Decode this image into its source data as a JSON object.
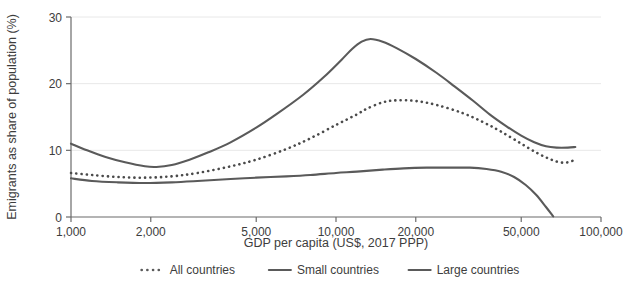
{
  "chart_data": {
    "type": "line",
    "title": "",
    "xlabel": "GDP per capita (US$, 2017 PPP)",
    "ylabel": "Emigrants as share of population (%)",
    "x_scale": "log",
    "xlim": [
      1000,
      100000
    ],
    "ylim": [
      0,
      30
    ],
    "xticks": [
      1000,
      2000,
      5000,
      10000,
      20000,
      50000,
      100000
    ],
    "xtick_labels": [
      "1,000",
      "2,000",
      "5,000",
      "10,000",
      "20,000",
      "50,000",
      "100,000"
    ],
    "yticks": [
      0,
      10,
      20,
      30
    ],
    "ytick_labels": [
      "0",
      "10",
      "20",
      "30"
    ],
    "grid": "horizontal",
    "legend_position": "bottom",
    "series": [
      {
        "name": "All countries",
        "style": "dotted",
        "color": "#4a4a4a",
        "points": [
          [
            1000,
            6.6
          ],
          [
            1200,
            6.3
          ],
          [
            1500,
            6.0
          ],
          [
            1900,
            5.9
          ],
          [
            2400,
            6.1
          ],
          [
            3000,
            6.6
          ],
          [
            4000,
            7.6
          ],
          [
            5000,
            8.6
          ],
          [
            6500,
            10.2
          ],
          [
            8000,
            11.8
          ],
          [
            10000,
            13.8
          ],
          [
            12000,
            15.4
          ],
          [
            13000,
            16.2
          ],
          [
            15000,
            17.2
          ],
          [
            17000,
            17.5
          ],
          [
            20000,
            17.4
          ],
          [
            24000,
            16.8
          ],
          [
            30000,
            15.6
          ],
          [
            36000,
            14.2
          ],
          [
            42000,
            12.8
          ],
          [
            50000,
            11.0
          ],
          [
            58000,
            9.5
          ],
          [
            65000,
            8.6
          ],
          [
            70000,
            8.2
          ],
          [
            75000,
            8.2
          ],
          [
            80000,
            8.6
          ]
        ]
      },
      {
        "name": "Small countries",
        "style": "solid",
        "color": "#5a5a5a",
        "points": [
          [
            1000,
            11.0
          ],
          [
            1150,
            10.0
          ],
          [
            1350,
            9.0
          ],
          [
            1600,
            8.2
          ],
          [
            1900,
            7.6
          ],
          [
            2100,
            7.5
          ],
          [
            2400,
            7.8
          ],
          [
            2800,
            8.6
          ],
          [
            3300,
            9.7
          ],
          [
            4000,
            11.2
          ],
          [
            5000,
            13.4
          ],
          [
            6000,
            15.5
          ],
          [
            7500,
            18.3
          ],
          [
            9000,
            21.0
          ],
          [
            10500,
            23.6
          ],
          [
            11500,
            25.2
          ],
          [
            12500,
            26.3
          ],
          [
            13500,
            26.7
          ],
          [
            15000,
            26.3
          ],
          [
            17000,
            25.3
          ],
          [
            20000,
            23.7
          ],
          [
            24000,
            21.6
          ],
          [
            28000,
            19.6
          ],
          [
            33000,
            17.4
          ],
          [
            38000,
            15.4
          ],
          [
            44000,
            13.6
          ],
          [
            50000,
            12.2
          ],
          [
            56000,
            11.2
          ],
          [
            62000,
            10.6
          ],
          [
            68000,
            10.4
          ],
          [
            75000,
            10.4
          ],
          [
            80000,
            10.5
          ]
        ]
      },
      {
        "name": "Large countries",
        "style": "solid",
        "color": "#5a5a5a",
        "points": [
          [
            1000,
            5.8
          ],
          [
            1200,
            5.4
          ],
          [
            1500,
            5.2
          ],
          [
            1900,
            5.1
          ],
          [
            2400,
            5.2
          ],
          [
            3000,
            5.4
          ],
          [
            4000,
            5.7
          ],
          [
            5000,
            5.9
          ],
          [
            6500,
            6.1
          ],
          [
            8000,
            6.3
          ],
          [
            10000,
            6.6
          ],
          [
            12000,
            6.8
          ],
          [
            15000,
            7.1
          ],
          [
            18000,
            7.3
          ],
          [
            22000,
            7.4
          ],
          [
            27000,
            7.4
          ],
          [
            32000,
            7.4
          ],
          [
            37000,
            7.2
          ],
          [
            42000,
            6.8
          ],
          [
            47000,
            6.0
          ],
          [
            52000,
            4.8
          ],
          [
            57000,
            3.3
          ],
          [
            62000,
            1.5
          ],
          [
            66000,
            0.1
          ]
        ]
      }
    ],
    "legend": [
      {
        "label": "All countries",
        "style": "dotted"
      },
      {
        "label": "Small countries",
        "style": "solid"
      },
      {
        "label": "Large countries",
        "style": "solid"
      }
    ]
  },
  "colors": {
    "line": "#5a5a5a",
    "grid": "#e8e8e8",
    "axis": "#6b6b6b",
    "text": "#3d3d3d",
    "background": "#ffffff"
  }
}
